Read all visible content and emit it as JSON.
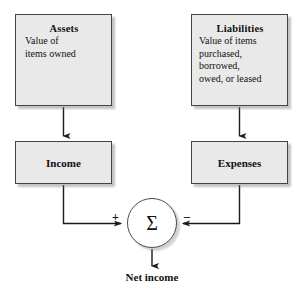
{
  "diagram": {
    "colors": {
      "box_fill": "#e9e9e9",
      "box_border": "#444444",
      "line": "#1a1a1a",
      "background": "#ffffff",
      "shadow": "#8c8c8c"
    },
    "nodes": {
      "assets": {
        "title": "Assets",
        "body": "Value of\nitems owned"
      },
      "liabilities": {
        "title": "Liabilities",
        "body": "Value of items\npurchased,\nborrowed,\nowed, or leased"
      },
      "income": {
        "label": "Income"
      },
      "expenses": {
        "label": "Expenses"
      },
      "summation": {
        "symbol": "Σ",
        "plus_sign": "+",
        "minus_sign": "–"
      },
      "net_income": {
        "label": "Net income"
      }
    }
  }
}
